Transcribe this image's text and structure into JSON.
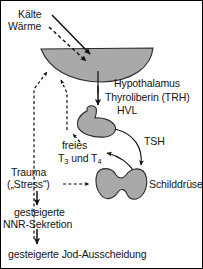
{
  "diagram": {
    "language": "de",
    "background_color": "#ffffff",
    "organ_fill_color": "#a9a9a9",
    "organ_stroke_color": "#2b2b2b",
    "line_color": "#111111"
  },
  "labels": {
    "kaelte": "Kälte",
    "waerme": "Wärme",
    "hypothalamus": "Hypothalamus",
    "thyroliberin": "Thyroliberin (TRH)",
    "hvl": "HVL",
    "tsh": "TSH",
    "freies": "freies",
    "t3_t4_prefix": "T",
    "t3_sub": "3",
    "t3_t4_middle": " und T",
    "t4_sub": "4",
    "t3_und_t4": "T3 und T4",
    "trauma": "Trauma",
    "stress": "(„Stress“)",
    "schilddruese": "Schilddrüse",
    "nnr_line1": "gesteigerte",
    "nnr_line2": "NNR-Sekretion",
    "jod": "gesteigerte Jod-Ausscheidung"
  },
  "organs": [
    {
      "name": "hypothalamus",
      "label": "Hypothalamus",
      "shape": "crescent"
    },
    {
      "name": "hypophyse",
      "label": "HVL",
      "shape": "pituitary"
    },
    {
      "name": "schilddruese",
      "label": "Schilddrüse",
      "shape": "thyroid-butterfly"
    }
  ],
  "connections": [
    {
      "from": "Kälte",
      "to": "Hypothalamus",
      "style": "solid",
      "direction": "stimulating"
    },
    {
      "from": "Wärme",
      "to": "Hypothalamus",
      "style": "dashed",
      "direction": "inhibiting"
    },
    {
      "from": "Hypothalamus",
      "to": "HVL",
      "style": "solid",
      "label": "Thyroliberin (TRH)"
    },
    {
      "from": "HVL",
      "to": "Schilddrüse",
      "style": "solid",
      "label": "TSH"
    },
    {
      "from": "Schilddrüse",
      "to": "freies T3 und T4",
      "style": "solid"
    },
    {
      "from": "freies T3 und T4",
      "to": "HVL",
      "style": "dashed",
      "direction": "feedback"
    },
    {
      "from": "freies T3 und T4",
      "to": "Hypothalamus",
      "style": "dashed",
      "direction": "feedback"
    },
    {
      "from": "Trauma („Stress“)",
      "to": "Schilddrüse",
      "style": "dashed"
    },
    {
      "from": "Trauma („Stress“)",
      "to": "gesteigerte NNR-Sekretion",
      "style": "solid"
    },
    {
      "from": "gesteigerte NNR-Sekretion",
      "to": "gesteigerte Jod-Ausscheidung",
      "style": "solid"
    },
    {
      "from": "gesteigerte Jod-Ausscheidung",
      "to": "Hypothalamus",
      "style": "dashed",
      "direction": "feedback"
    }
  ]
}
